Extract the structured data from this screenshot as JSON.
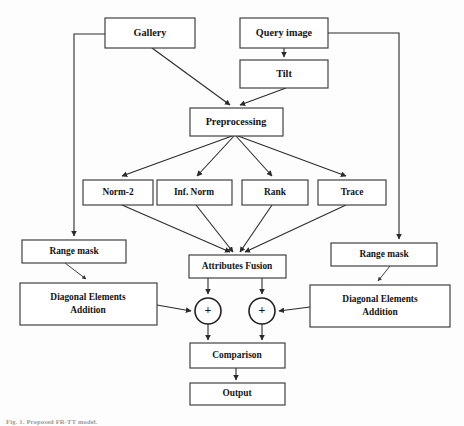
{
  "figure": {
    "type": "flowchart",
    "caption": "Fig. 1. Proposed FR-TT model.",
    "background_color": "#fdfdfd",
    "line_color": "#2b2b2b",
    "box_fill": "#ffffff",
    "text_color": "#141414"
  },
  "nodes": [
    {
      "id": "gallery",
      "label": "Gallery",
      "x": 105,
      "y": 18,
      "w": 90,
      "h": 30,
      "shape": "rect"
    },
    {
      "id": "query_image",
      "label": "Query image",
      "x": 240,
      "y": 18,
      "w": 88,
      "h": 30,
      "shape": "rect"
    },
    {
      "id": "tilt",
      "label": "Tilt",
      "x": 240,
      "y": 60,
      "w": 88,
      "h": 28,
      "shape": "rect"
    },
    {
      "id": "preprocessing",
      "label": "Preprocessing",
      "x": 190,
      "y": 108,
      "w": 93,
      "h": 28,
      "shape": "rect"
    },
    {
      "id": "norm2",
      "label": "Norm-2",
      "x": 83,
      "y": 180,
      "w": 70,
      "h": 25,
      "shape": "rect"
    },
    {
      "id": "inf_norm",
      "label": "Inf. Norm",
      "x": 157,
      "y": 180,
      "w": 75,
      "h": 25,
      "shape": "rect"
    },
    {
      "id": "rank",
      "label": "Rank",
      "x": 242,
      "y": 180,
      "w": 66,
      "h": 25,
      "shape": "rect"
    },
    {
      "id": "trace",
      "label": "Trace",
      "x": 318,
      "y": 180,
      "w": 68,
      "h": 25,
      "shape": "rect"
    },
    {
      "id": "range_mask_left",
      "label": "Range mask",
      "x": 22,
      "y": 240,
      "w": 104,
      "h": 23,
      "shape": "rect"
    },
    {
      "id": "range_mask_right",
      "label": "Range mask",
      "x": 331,
      "y": 243,
      "w": 106,
      "h": 23,
      "shape": "rect"
    },
    {
      "id": "diag_left",
      "label": "Diagonal Elements Addition",
      "x": 20,
      "y": 283,
      "w": 137,
      "h": 42,
      "shape": "rect",
      "lines": [
        "Diagonal Elements",
        "Addition"
      ]
    },
    {
      "id": "diag_right",
      "label": "Diagonal Elements Addition",
      "x": 310,
      "y": 285,
      "w": 140,
      "h": 42,
      "shape": "rect",
      "lines": [
        "Diagonal Elements",
        "Addition"
      ]
    },
    {
      "id": "attr_fusion",
      "label": "Attributes Fusion",
      "x": 189,
      "y": 255,
      "w": 97,
      "h": 23,
      "shape": "rect"
    },
    {
      "id": "sum_left",
      "label": "+",
      "cx": 208,
      "cy": 311,
      "r": 13,
      "shape": "circle"
    },
    {
      "id": "sum_right",
      "label": "+",
      "cx": 262,
      "cy": 311,
      "r": 13,
      "shape": "circle"
    },
    {
      "id": "comparison",
      "label": "Comparison",
      "x": 190,
      "y": 343,
      "w": 95,
      "h": 25,
      "shape": "rect"
    },
    {
      "id": "output",
      "label": "Output",
      "x": 190,
      "y": 383,
      "w": 95,
      "h": 22,
      "shape": "rect"
    }
  ],
  "edges": [
    {
      "from": "gallery",
      "to": "preprocessing",
      "style": "diagonal"
    },
    {
      "from": "query_image",
      "to": "tilt",
      "style": "straight"
    },
    {
      "from": "tilt",
      "to": "preprocessing",
      "style": "diagonal"
    },
    {
      "from": "preprocessing",
      "to": "norm2",
      "style": "fan"
    },
    {
      "from": "preprocessing",
      "to": "inf_norm",
      "style": "fan"
    },
    {
      "from": "preprocessing",
      "to": "rank",
      "style": "fan"
    },
    {
      "from": "preprocessing",
      "to": "trace",
      "style": "fan"
    },
    {
      "from": "norm2",
      "to": "attr_fusion",
      "style": "fan"
    },
    {
      "from": "inf_norm",
      "to": "attr_fusion",
      "style": "fan"
    },
    {
      "from": "rank",
      "to": "attr_fusion",
      "style": "fan"
    },
    {
      "from": "trace",
      "to": "attr_fusion",
      "style": "fan"
    },
    {
      "from": "gallery",
      "to": "range_mask_left",
      "style": "orthogonal-left"
    },
    {
      "from": "query_image",
      "to": "range_mask_right",
      "style": "orthogonal-right"
    },
    {
      "from": "range_mask_left",
      "to": "diag_left",
      "style": "diagonal"
    },
    {
      "from": "range_mask_right",
      "to": "diag_right",
      "style": "diagonal"
    },
    {
      "from": "attr_fusion",
      "to": "sum_left",
      "style": "straight"
    },
    {
      "from": "attr_fusion",
      "to": "sum_right",
      "style": "straight"
    },
    {
      "from": "diag_left",
      "to": "sum_left",
      "style": "horizontal"
    },
    {
      "from": "diag_right",
      "to": "sum_right",
      "style": "horizontal"
    },
    {
      "from": "sum_left",
      "to": "comparison",
      "style": "straight"
    },
    {
      "from": "sum_right",
      "to": "comparison",
      "style": "straight"
    },
    {
      "from": "comparison",
      "to": "output",
      "style": "straight"
    }
  ]
}
